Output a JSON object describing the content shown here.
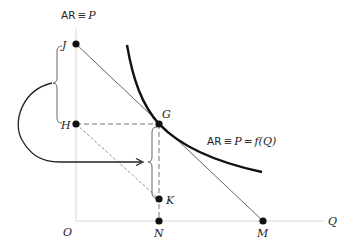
{
  "diagram": {
    "axes": {
      "y_label_ar": "AR",
      "y_label_equiv": "≡",
      "y_label_p": "P",
      "x_label": "Q",
      "origin_label": "O"
    },
    "curve_label": {
      "ar": "AR",
      "equiv": "≡",
      "p": "P",
      "eq": "=",
      "f": "f(Q)"
    },
    "points": {
      "J": "J",
      "H": "H",
      "G": "G",
      "K": "K",
      "N": "N",
      "M": "M"
    },
    "colors": {
      "axis": "#d8d8d8",
      "curve": "#111111",
      "line": "#555555",
      "dash": "#777777",
      "point": "#111111"
    }
  }
}
